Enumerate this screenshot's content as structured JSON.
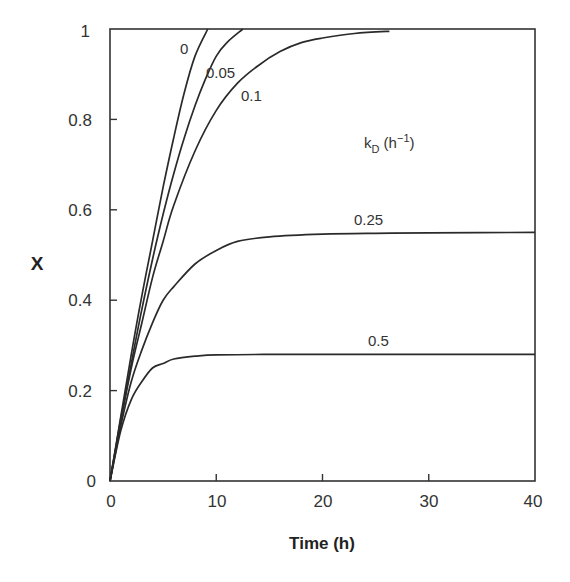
{
  "chart_data": {
    "type": "line",
    "title": "",
    "xlabel": "Time (h)",
    "ylabel": "X",
    "xlim": [
      0,
      40
    ],
    "ylim": [
      0,
      1
    ],
    "xticks": [
      "0",
      "10",
      "20",
      "30",
      "40"
    ],
    "yticks": [
      "0",
      "0.2",
      "0.4",
      "0.6",
      "0.8",
      "1"
    ],
    "grid": false,
    "legend_title": "k_D (h^-1)",
    "annotation": "kD (h−1)",
    "series": [
      {
        "name": "0",
        "x": [
          0,
          1,
          2,
          3,
          4,
          5,
          6,
          7,
          8,
          9.2
        ],
        "y": [
          0,
          0.14,
          0.28,
          0.41,
          0.53,
          0.65,
          0.76,
          0.86,
          0.94,
          1.0
        ]
      },
      {
        "name": "0.05",
        "x": [
          0,
          1,
          2,
          3,
          4,
          5,
          6,
          7,
          8,
          9,
          10,
          11,
          12.5
        ],
        "y": [
          0,
          0.135,
          0.26,
          0.38,
          0.49,
          0.59,
          0.68,
          0.76,
          0.83,
          0.89,
          0.94,
          0.97,
          1.0
        ]
      },
      {
        "name": "0.1",
        "x": [
          0,
          1,
          2,
          3,
          4,
          5,
          6,
          8,
          10,
          12,
          14,
          16,
          18,
          20,
          23,
          26.3
        ],
        "y": [
          0,
          0.13,
          0.25,
          0.35,
          0.45,
          0.53,
          0.61,
          0.73,
          0.82,
          0.88,
          0.92,
          0.95,
          0.97,
          0.98,
          0.99,
          0.995
        ]
      },
      {
        "name": "0.25",
        "x": [
          0,
          1,
          2,
          3,
          4,
          5,
          6,
          8,
          10,
          12,
          15,
          20,
          25,
          30,
          40
        ],
        "y": [
          0,
          0.12,
          0.22,
          0.29,
          0.35,
          0.4,
          0.43,
          0.48,
          0.51,
          0.53,
          0.54,
          0.546,
          0.548,
          0.549,
          0.55
        ]
      },
      {
        "name": "0.5",
        "x": [
          0,
          1,
          2,
          3,
          4,
          5,
          6,
          8,
          10,
          15,
          20,
          30,
          40
        ],
        "y": [
          0,
          0.11,
          0.18,
          0.22,
          0.25,
          0.26,
          0.27,
          0.276,
          0.279,
          0.28,
          0.28,
          0.28,
          0.28
        ]
      }
    ]
  },
  "labels": {
    "xlabel": "Time (h)",
    "ylabel": "X",
    "kd_main": "k",
    "kd_sub": "D",
    "kd_paren_open": " (h",
    "kd_sup": "−1",
    "kd_paren_close": ")",
    "curve_0": "0",
    "curve_005": "0.05",
    "curve_01": "0.1",
    "curve_025": "0.25",
    "curve_05": "0.5",
    "xt0": "0",
    "xt1": "10",
    "xt2": "20",
    "xt3": "30",
    "xt4": "40",
    "yt0": "0",
    "yt1": "0.2",
    "yt2": "0.4",
    "yt3": "0.6",
    "yt4": "0.8",
    "yt5": "1"
  }
}
